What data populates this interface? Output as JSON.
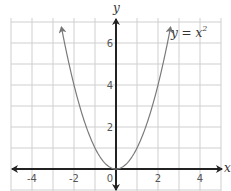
{
  "chart_data": {
    "type": "line",
    "title": "",
    "function": "y = x^2",
    "annotation": {
      "text_base": "y = x",
      "text_sup": "2"
    },
    "xlabel": "x",
    "ylabel": "y",
    "xlim": [
      -5,
      5
    ],
    "ylim": [
      -1,
      7
    ],
    "x_ticks": [
      -4,
      -2,
      0,
      2,
      4
    ],
    "y_ticks": [
      2,
      4,
      6
    ],
    "x_tick_labels": [
      "-4",
      "-2",
      "0",
      "2",
      "4"
    ],
    "y_tick_labels": [
      "2",
      "4",
      "6"
    ],
    "grid": true,
    "grid_step": 1,
    "series": [
      {
        "name": "y = x^2",
        "x": [
          -2.6,
          -2,
          -1.5,
          -1,
          -0.5,
          0,
          0.5,
          1,
          1.5,
          2,
          2.6
        ],
        "values": [
          6.76,
          4,
          2.25,
          1,
          0.25,
          0,
          0.25,
          1,
          2.25,
          4,
          6.76
        ]
      }
    ],
    "colors": {
      "grid": "#cfcfcf",
      "axes": "#222222",
      "curve": "#7a7a7a"
    }
  }
}
